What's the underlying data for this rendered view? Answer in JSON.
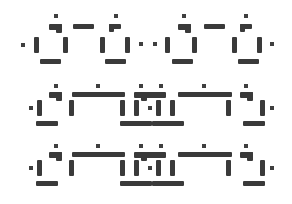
{
  "figure": {
    "background_color": "#ffffff",
    "ink_color": "#3a3a3a",
    "rows": [
      {
        "name": "row-1",
        "glyph_count": 4
      },
      {
        "name": "row-2",
        "glyph_count": 6
      },
      {
        "name": "row-3",
        "glyph_count": 6
      }
    ]
  }
}
